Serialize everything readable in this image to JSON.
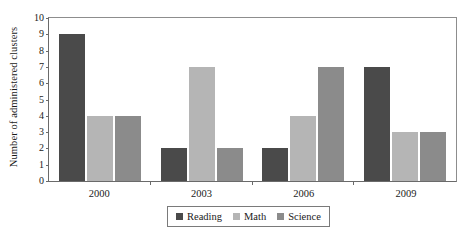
{
  "chart_data": {
    "type": "bar",
    "title": "",
    "xlabel": "",
    "ylabel": "Number of administered clusters",
    "categories": [
      "2000",
      "2003",
      "2006",
      "2009"
    ],
    "series": [
      {
        "name": "Reading",
        "color": "#4a4a4a",
        "values": [
          9,
          2,
          2,
          7
        ]
      },
      {
        "name": "Math",
        "color": "#b5b5b5",
        "values": [
          4,
          7,
          4,
          3
        ]
      },
      {
        "name": "Science",
        "color": "#8b8b8b",
        "values": [
          4,
          2,
          7,
          3
        ]
      }
    ],
    "ylim": [
      0,
      10
    ],
    "yticks": [
      0,
      1,
      2,
      3,
      4,
      5,
      6,
      7,
      8,
      9,
      10
    ],
    "ytick_labels": [
      "0",
      "1",
      "2",
      "3",
      "4",
      "5",
      "6",
      "7",
      "8",
      "9",
      "10"
    ],
    "grid": false,
    "legend_position": "bottom-center",
    "frame_color": "#6a6a6a",
    "background": "#ffffff"
  }
}
